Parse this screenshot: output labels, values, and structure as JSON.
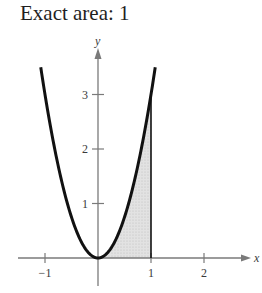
{
  "title": "Exact area: 1",
  "chart_data": {
    "type": "area",
    "title": "Exact area: 1",
    "function": "y = 3x^2",
    "curve": {
      "x": [
        -1.08,
        -1.0,
        -0.75,
        -0.5,
        -0.25,
        0,
        0.25,
        0.5,
        0.75,
        1.0,
        1.08
      ],
      "y": [
        3.5,
        3.0,
        1.6875,
        0.75,
        0.1875,
        0,
        0.1875,
        0.75,
        1.6875,
        3.0,
        3.5
      ]
    },
    "shaded_region": {
      "from_x": 0,
      "to_x": 1,
      "area": 1,
      "description": "Region under y=3x^2 from x=0 to x=1"
    },
    "xlabel": "x",
    "ylabel": "y",
    "x_ticks": [
      -1,
      1,
      2
    ],
    "x_tick_labels": [
      "−1",
      "1",
      "2"
    ],
    "y_ticks": [
      1,
      2,
      3
    ],
    "y_tick_labels": [
      "1",
      "2",
      "3"
    ],
    "xlim": [
      -1.55,
      2.9
    ],
    "ylim": [
      -0.5,
      3.7
    ],
    "grid": false,
    "legend": null
  },
  "colors": {
    "curve": "#111111",
    "axes": "#7a7a7a",
    "shade": "#d8d8d8",
    "text": "#1f1f1f"
  }
}
